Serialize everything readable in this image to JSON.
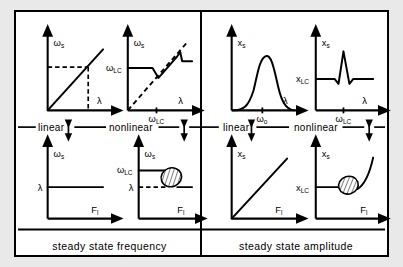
{
  "figure": {
    "background_color": "#e9e9e9",
    "panel_color": "#ffffff",
    "ink_color": "#000000"
  },
  "columns": [
    {
      "id": "frequency",
      "caption": "steady state frequency"
    },
    {
      "id": "amplitude",
      "caption": "steady state amplitude"
    }
  ],
  "dividers": [
    {
      "id": "freq-linear",
      "label": "linear"
    },
    {
      "id": "freq-nonlinear",
      "label": "nonlinear"
    },
    {
      "id": "amp-linear",
      "label": "linear"
    },
    {
      "id": "amp-nonlinear",
      "label": "nonlinear"
    }
  ],
  "axis_symbols": {
    "omega_s": "ω",
    "omega_s_sub": "s",
    "omega_lc": "ω",
    "omega_lc_sub": "LC",
    "omega_0": "ω",
    "omega_0_sub": "o",
    "lambda": "λ",
    "x_s": "x",
    "x_s_sub": "s",
    "x_lc": "x",
    "x_lc_sub": "LC",
    "force": "F",
    "force_sub": "l"
  },
  "panels": [
    {
      "id": "freq-linear-panel",
      "title": "linear steady state frequency vs lambda",
      "ylabel": "ωs",
      "xlabel": "λ",
      "xticks": [],
      "yticks": [],
      "description": "straight proportional line through origin with dashed projection lines to a marked operating point"
    },
    {
      "id": "freq-nonlinear-panel",
      "title": "nonlinear steady state frequency vs lambda",
      "ylabel": "ωs",
      "xlabel": "λ",
      "xticks": [
        "ωLC"
      ],
      "yticks": [
        "ωLC"
      ],
      "description": "locked plateau at omega LC, drop to rising branch following dashed identity line, then jump up to a higher plateau"
    },
    {
      "id": "amp-linear-panel",
      "title": "linear steady state amplitude vs lambda",
      "ylabel": "xs",
      "xlabel": "λ",
      "xticks": [
        "ωo"
      ],
      "yticks": [],
      "description": "single resonance peak centred at omega zero decaying to zero on both sides"
    },
    {
      "id": "amp-nonlinear-panel",
      "title": "nonlinear steady state amplitude vs lambda",
      "ylabel": "xs",
      "xlabel": "λ",
      "xticks": [
        "ωLC"
      ],
      "yticks": [
        "xLC"
      ],
      "description": "flat baseline at x LC with a narrow sharp spike at omega LC flanked by small dips"
    },
    {
      "id": "freq-force-linear-panel",
      "title": "linear steady state frequency vs forcing",
      "ylabel": "ωs",
      "xlabel": "Fl",
      "xticks": [],
      "yticks": [
        "λ"
      ],
      "description": "horizontal constant line at lambda independent of forcing amplitude"
    },
    {
      "id": "freq-force-nonlinear-panel",
      "title": "nonlinear steady state frequency vs forcing",
      "ylabel": "ωs",
      "xlabel": "Fl",
      "xticks": [],
      "yticks": [
        "ωLC",
        "λ"
      ],
      "description": "plateau at omega LC, hatched transition region, then horizontal line at lambda with dashed lambda guide"
    },
    {
      "id": "amp-force-linear-panel",
      "title": "linear steady state amplitude vs forcing",
      "ylabel": "xs",
      "xlabel": "Fl",
      "xticks": [],
      "yticks": [],
      "description": "straight proportional line rising from the origin"
    },
    {
      "id": "amp-force-nonlinear-panel",
      "title": "nonlinear steady state amplitude vs forcing",
      "ylabel": "xs",
      "xlabel": "Fl",
      "xticks": [],
      "yticks": [
        "xLC"
      ],
      "description": "flat plateau at x LC, hatched transition blob, then curve rising steeply"
    }
  ]
}
